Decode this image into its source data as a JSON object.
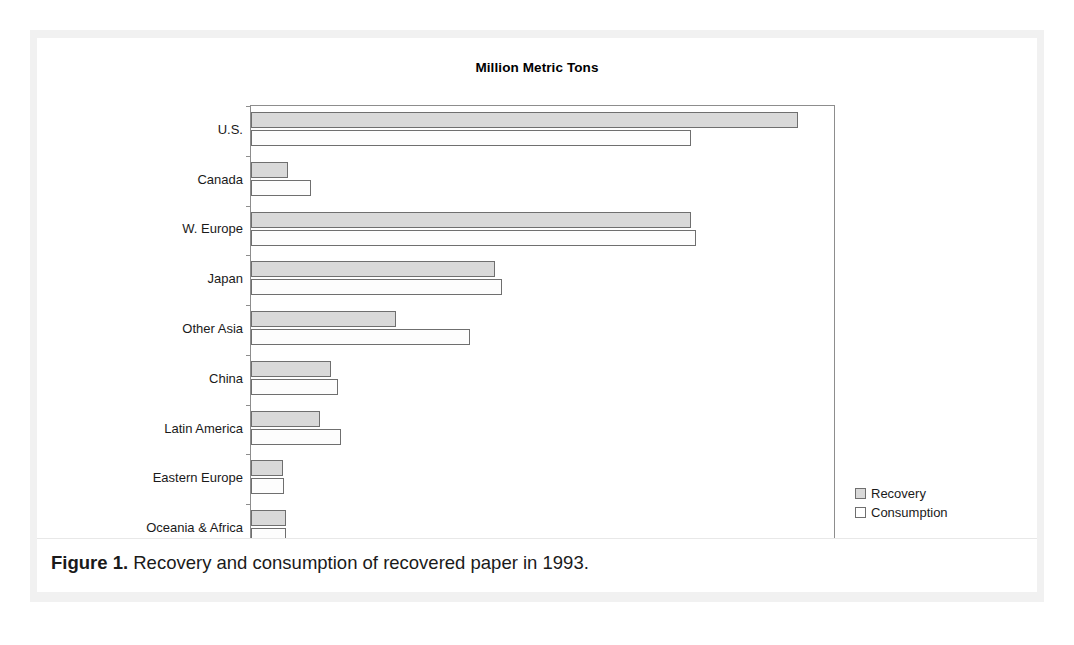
{
  "figure": {
    "caption_label": "Figure 1.",
    "caption_text": " Recovery and consumption of recovered paper in 1993."
  },
  "colors": {
    "recovery_fill": "#d9d9d9",
    "consumption_fill": "#ffffff",
    "bar_stroke": "#6f6f6f",
    "axis": "#8d8d8d",
    "frame": "#f1f1f1",
    "text": "#1a1a1a"
  },
  "chart_data": {
    "type": "bar",
    "orientation": "horizontal",
    "title": "Million Metric Tons",
    "xlabel": "",
    "ylabel": "",
    "xlim": [
      0,
      35
    ],
    "xticks": [
      0,
      5,
      10,
      15,
      20,
      25,
      30,
      35
    ],
    "grid": false,
    "legend_position": "right-bottom",
    "categories": [
      "U.S.",
      "Canada",
      "W. Europe",
      "Japan",
      "Other Asia",
      "China",
      "Latin America",
      "Eastern Europe",
      "Oceania & Africa"
    ],
    "series": [
      {
        "name": "Recovery",
        "values": [
          32.7,
          2.2,
          26.3,
          14.6,
          8.7,
          4.8,
          4.1,
          1.9,
          2.1
        ]
      },
      {
        "name": "Consumption",
        "values": [
          26.3,
          3.6,
          26.6,
          15.0,
          13.1,
          5.2,
          5.4,
          2.0,
          2.1
        ]
      }
    ]
  }
}
